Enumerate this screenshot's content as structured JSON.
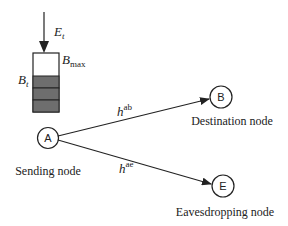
{
  "diagram": {
    "energy_input": {
      "symbol": "E",
      "subscript": "t"
    },
    "battery": {
      "max_label": {
        "symbol": "B",
        "subscript": "max"
      },
      "level_label": {
        "symbol": "B",
        "subscript": "t"
      },
      "filled_cells": 3,
      "fill_color": "#6e6e6e"
    },
    "nodes": [
      {
        "id": "A",
        "label": "A",
        "caption": "Sending node"
      },
      {
        "id": "B",
        "label": "B",
        "caption": "Destination node"
      },
      {
        "id": "E",
        "label": "E",
        "caption": "Eavesdropping node"
      }
    ],
    "links": [
      {
        "from": "A",
        "to": "B",
        "symbol": "h",
        "superscript": "ab"
      },
      {
        "from": "A",
        "to": "E",
        "symbol": "h",
        "superscript": "ae"
      }
    ],
    "colors": {
      "stroke": "#222222",
      "background": "#ffffff"
    }
  }
}
